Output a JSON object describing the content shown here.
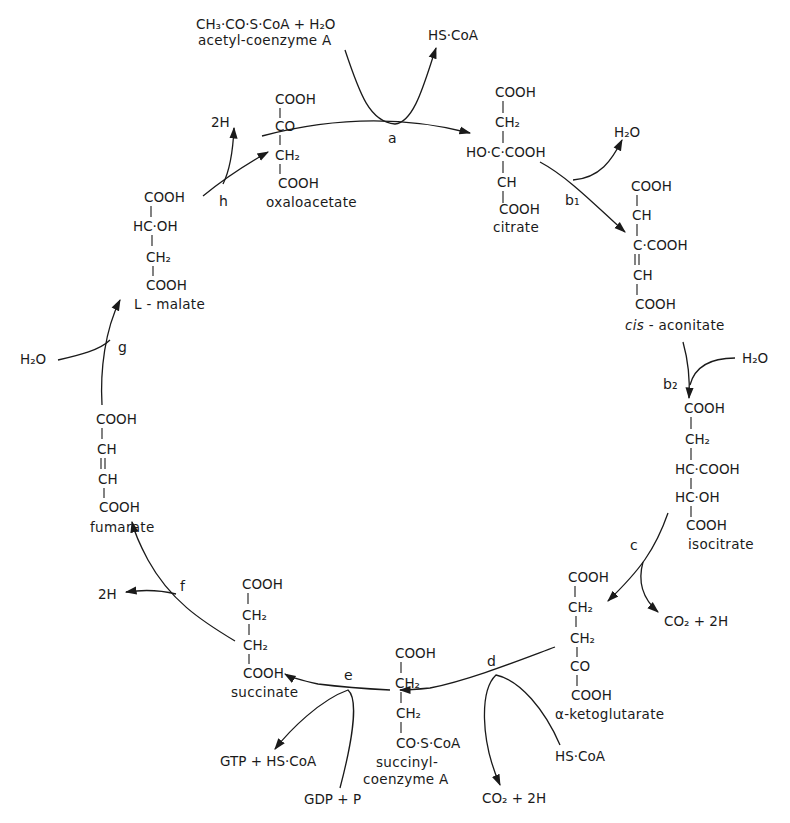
{
  "compounds": {
    "acetyl_coa": {
      "formula": "CH₃·CO·S·CoA + H₂O",
      "name": "acetyl-coenzyme A"
    },
    "oxaloacetate": {
      "lines": [
        "COOH",
        "CO",
        "CH₂",
        "COOH"
      ],
      "name": "oxaloacetate"
    },
    "citrate": {
      "lines": [
        "COOH",
        "CH₂",
        "HO·C·COOH",
        "CH",
        "COOH"
      ],
      "name": "citrate"
    },
    "cis_aconitate": {
      "lines": [
        "COOH",
        "CH",
        "C·COOH",
        "CH",
        "COOH"
      ],
      "name_italic": "cis",
      "name": " - aconitate"
    },
    "isocitrate": {
      "lines": [
        "COOH",
        "CH₂",
        "HC·COOH",
        "HC·OH",
        "COOH"
      ],
      "name": "isocitrate"
    },
    "alpha_ketoglutarate": {
      "lines": [
        "COOH",
        "CH₂",
        "CH₂",
        "CO",
        "COOH"
      ],
      "name": "α-ketoglutarate"
    },
    "succinyl_coa": {
      "lines": [
        "COOH",
        "CH₂",
        "CH₂",
        "CO·S·CoA"
      ],
      "name_line1": "succinyl-",
      "name_line2": "coenzyme A"
    },
    "succinate": {
      "lines": [
        "COOH",
        "CH₂",
        "CH₂",
        "COOH"
      ],
      "name": "succinate"
    },
    "fumarate": {
      "lines": [
        "COOH",
        "CH",
        "CH",
        "COOH"
      ],
      "name": "fumarate"
    },
    "l_malate": {
      "lines": [
        "COOH",
        "HC·OH",
        "CH₂",
        "COOH"
      ],
      "name": "L - malate"
    }
  },
  "steps": {
    "a": {
      "label": "a",
      "out": "HS·CoA"
    },
    "b1": {
      "label": "b₁",
      "out": "H₂O"
    },
    "b2": {
      "label": "b₂",
      "in": "H₂O"
    },
    "c": {
      "label": "c",
      "out": "CO₂ + 2H"
    },
    "d": {
      "label": "d",
      "in": "HS·CoA",
      "out": "CO₂ + 2H"
    },
    "e": {
      "label": "e",
      "in": "GDP + P",
      "out": "GTP + HS·CoA"
    },
    "f": {
      "label": "f",
      "out": "2H"
    },
    "g": {
      "label": "g",
      "in": "H₂O"
    },
    "h": {
      "label": "h",
      "out": "2H"
    }
  }
}
